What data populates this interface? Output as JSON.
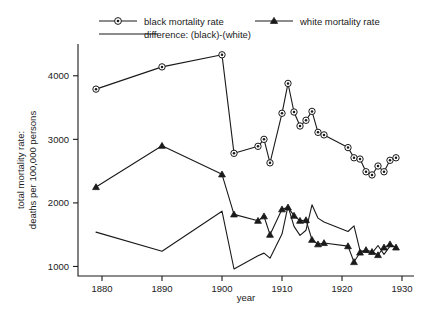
{
  "chart_data": {
    "type": "line",
    "title": "",
    "xlabel": "year",
    "ylabel": "total mortality rate:\ndeaths per 100,000 persons",
    "ylabel_line1": "total mortality rate:",
    "ylabel_line2": "deaths per 100,000 persons",
    "xlim": [
      1876,
      1932
    ],
    "ylim": [
      850,
      4500
    ],
    "grid": false,
    "legend_position": "top",
    "xticks": [
      1880,
      1890,
      1900,
      1910,
      1920,
      1930
    ],
    "xtick_labels": [
      "1880",
      "1890",
      "1900",
      "1910",
      "1920",
      "1930"
    ],
    "yticks": [
      1000,
      2000,
      3000,
      4000
    ],
    "ytick_labels": [
      "1000",
      "2000",
      "3000",
      "4000"
    ],
    "series": [
      {
        "name": "black mortality rate",
        "marker": "circle-dot",
        "color": "#1a1a1a",
        "x": [
          1879,
          1890,
          1900,
          1902,
          1906,
          1907,
          1908,
          1910,
          1911,
          1912,
          1913,
          1914,
          1915,
          1916,
          1917,
          1921,
          1922,
          1923,
          1924,
          1925,
          1926,
          1927,
          1928,
          1929
        ],
        "values": [
          3790,
          4140,
          4330,
          2780,
          2890,
          3000,
          2630,
          3410,
          3880,
          3430,
          3210,
          3300,
          3440,
          3110,
          3070,
          2870,
          2710,
          2690,
          2490,
          2440,
          2580,
          2490,
          2670,
          2710
        ]
      },
      {
        "name": "white mortality rate",
        "marker": "triangle",
        "color": "#1a1a1a",
        "x": [
          1879,
          1890,
          1900,
          1902,
          1906,
          1907,
          1908,
          1910,
          1911,
          1912,
          1913,
          1914,
          1915,
          1916,
          1917,
          1921,
          1922,
          1923,
          1924,
          1925,
          1926,
          1927,
          1928,
          1929
        ],
        "values": [
          2250,
          2900,
          2450,
          1820,
          1720,
          1790,
          1500,
          1900,
          1930,
          1800,
          1720,
          1730,
          1420,
          1350,
          1370,
          1320,
          1070,
          1220,
          1260,
          1230,
          1180,
          1300,
          1350,
          1300
        ]
      },
      {
        "name": "difference:  (black)-(white)",
        "marker": "none",
        "color": "#1a1a1a",
        "x": [
          1879,
          1890,
          1900,
          1902,
          1906,
          1907,
          1908,
          1910,
          1911,
          1912,
          1913,
          1914,
          1915,
          1916,
          1917,
          1921,
          1922,
          1923,
          1924,
          1925,
          1926,
          1927,
          1928,
          1929
        ],
        "values": [
          1540,
          1240,
          1870,
          960,
          1170,
          1210,
          1130,
          1510,
          1950,
          1630,
          1490,
          1570,
          1970,
          1760,
          1700,
          1550,
          1640,
          1250,
          1230,
          1210,
          1330,
          1190,
          1320,
          1310
        ]
      }
    ]
  },
  "legend": {
    "items": [
      {
        "label": "black mortality rate",
        "marker": "circle-dot"
      },
      {
        "label": "white mortality rate",
        "marker": "triangle"
      },
      {
        "label": "difference:  (black)-(white)",
        "marker": "none"
      }
    ]
  }
}
